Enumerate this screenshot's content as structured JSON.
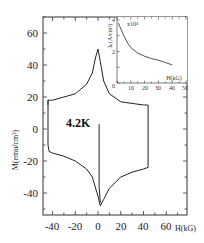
{
  "chart_data": [
    {
      "type": "line",
      "title": "",
      "xlabel": "H(kG)",
      "ylabel": "M(emu/cm³)",
      "xlim": [
        -48,
        78
      ],
      "ylim": [
        -54,
        70
      ],
      "x_ticks": [
        -40,
        -20,
        0,
        20,
        40,
        60
      ],
      "y_ticks": [
        60,
        40,
        20,
        0,
        -20,
        -40
      ],
      "grid": false,
      "annotation": "4.2K",
      "series": [
        {
          "name": "upper branch (decreasing H)",
          "x": [
            44,
            40,
            30,
            20,
            10,
            5,
            2,
            0,
            -2,
            -5,
            -10,
            -20,
            -30,
            -40,
            -44,
            -44
          ],
          "y": [
            15,
            15,
            16,
            17,
            22,
            30,
            42,
            50,
            45,
            35,
            28,
            22,
            20,
            18,
            18,
            15
          ]
        },
        {
          "name": "descending edge (H=-44)",
          "x": [
            -44,
            -44,
            -43
          ],
          "y": [
            18,
            -10,
            -14
          ]
        },
        {
          "name": "lower branch (increasing H)",
          "x": [
            -43,
            -40,
            -30,
            -20,
            -10,
            -5,
            0,
            2,
            5,
            10,
            20,
            30,
            40,
            44
          ],
          "y": [
            -14,
            -15,
            -17,
            -20,
            -25,
            -30,
            -42,
            -48,
            -44,
            -37,
            -30,
            -27,
            -25,
            -24
          ]
        },
        {
          "name": "ascending edge (H=44)",
          "x": [
            44,
            44
          ],
          "y": [
            -24,
            15
          ]
        },
        {
          "name": "virgin curve",
          "x": [
            1,
            1,
            2
          ],
          "y": [
            3,
            -36,
            -46
          ]
        }
      ]
    },
    {
      "type": "line",
      "title": "inset",
      "xlabel": "H(kG)",
      "ylabel": "J_c(A/cm²)",
      "y_multiplier": "x10⁴",
      "xlim": [
        0,
        50
      ],
      "ylim": [
        0,
        4
      ],
      "x_ticks": [
        0,
        10,
        20,
        30,
        40,
        50
      ],
      "y_ticks": [
        0,
        2,
        4
      ],
      "series": [
        {
          "name": "Jc vs H",
          "x": [
            1,
            3,
            5,
            8,
            10,
            15,
            20,
            25,
            30,
            35,
            40
          ],
          "y": [
            3.8,
            3.4,
            3.0,
            2.5,
            2.25,
            1.9,
            1.7,
            1.55,
            1.45,
            1.3,
            1.15
          ]
        }
      ]
    }
  ],
  "labels": {
    "y_title": "M(emu/cm³)",
    "x_title": "H(kG)",
    "annotation": "4.2K",
    "x_ticks": [
      "-40",
      "-20",
      "0",
      "20",
      "40",
      "60"
    ],
    "y_ticks": [
      "60",
      "40",
      "20",
      "0",
      "-20",
      "-40"
    ],
    "inset_y_title": "Jₖ(A/cm²)",
    "inset_multiplier": "x10⁴",
    "inset_x_title": "H(kG)",
    "inset_x_ticks": [
      "0",
      "10",
      "20",
      "30",
      "40",
      "50"
    ],
    "inset_y_ticks": [
      "2",
      "4"
    ],
    "inset_origin": "0"
  },
  "colors": {
    "line": "#222222",
    "axis": "#333333"
  }
}
